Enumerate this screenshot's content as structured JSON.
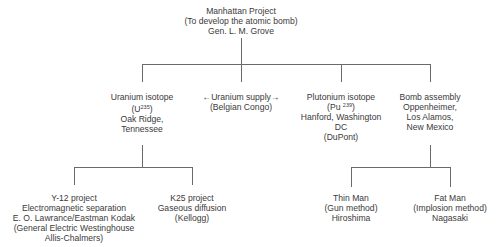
{
  "root": {
    "lines": [
      "Manhattan Project",
      "(To develop the atomic bomb)",
      "Gen. L. M. Grove"
    ]
  },
  "branches": [
    {
      "id": "uranium-isotope",
      "line1": "Uranium isotope",
      "formula_prefix": "(U",
      "formula_sup": "235",
      "formula_suffix": ")",
      "lines_after": [
        "Oak Ridge,",
        "Tennessee"
      ]
    },
    {
      "id": "uranium-supply",
      "lines": [
        "←Uranium supply→",
        "(Belgian Congo)"
      ]
    },
    {
      "id": "plutonium-isotope",
      "line1": "Plutonium isotope",
      "formula_prefix": "(Pu ",
      "formula_sup": "239",
      "formula_suffix": ")",
      "lines_after": [
        "Hanford, Washington",
        "DC",
        "(DuPont)"
      ]
    },
    {
      "id": "bomb-assembly",
      "lines": [
        "Bomb assembly",
        "Oppenheimer,",
        "Los Alamos,",
        "New Mexico"
      ]
    }
  ],
  "leaves": [
    {
      "id": "y12-project",
      "lines": [
        "Y-12 project",
        "Electromagnetic separation",
        "E. O. Lawrance/Eastman Kodak",
        "(General Electric Westinghouse",
        "Allis-Chalmers)"
      ]
    },
    {
      "id": "k25-project",
      "lines": [
        "K25 project",
        "Gaseous diffusion",
        "(Kellogg)"
      ]
    },
    {
      "id": "thin-man",
      "lines": [
        "Thin Man",
        "(Gun method)",
        "Hiroshima"
      ]
    },
    {
      "id": "fat-man",
      "lines": [
        "Fat Man",
        "(Implosion method)",
        "Nagasaki"
      ]
    }
  ]
}
